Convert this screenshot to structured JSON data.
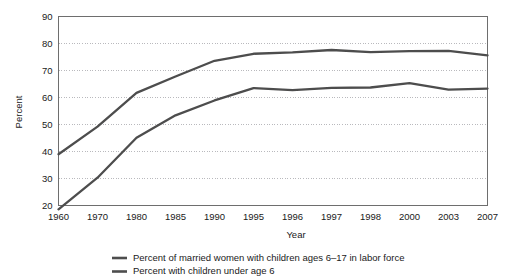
{
  "chart_data": {
    "type": "line",
    "title": "",
    "xlabel": "Year",
    "ylabel": "Percent",
    "ylim": [
      20,
      90
    ],
    "y_ticks": [
      20,
      30,
      40,
      50,
      60,
      70,
      80,
      90
    ],
    "grid": true,
    "legend_position": "bottom",
    "categories": [
      "1960",
      "1970",
      "1980",
      "1985",
      "1990",
      "1995",
      "1996",
      "1997",
      "1998",
      "2000",
      "2003",
      "2007"
    ],
    "series": [
      {
        "name": "Percent of married women with children ages 6–17 in labor force",
        "color": "#4d4d4d",
        "values": [
          39.0,
          49.2,
          61.7,
          67.8,
          73.6,
          76.2,
          76.7,
          77.6,
          76.8,
          77.2,
          77.3,
          75.6
        ]
      },
      {
        "name": "Percent with children under age 6",
        "color": "#4d4d4d",
        "values": [
          18.6,
          30.3,
          45.1,
          53.4,
          58.9,
          63.5,
          62.7,
          63.6,
          63.7,
          65.3,
          62.9,
          63.3
        ]
      }
    ]
  },
  "axis": {
    "y_title": "Percent",
    "x_title": "Year",
    "y_tick_labels": [
      "90",
      "80",
      "70",
      "60",
      "50",
      "40",
      "30",
      "20"
    ],
    "x_tick_labels": [
      "1960",
      "1970",
      "1980",
      "1985",
      "1990",
      "1995",
      "1996",
      "1997",
      "1998",
      "2000",
      "2003",
      "2007"
    ]
  },
  "legend": {
    "items": [
      {
        "label": "Percent of married women with children ages 6–17 in labor force",
        "color": "#4d4d4d"
      },
      {
        "label": "Percent with children under age 6",
        "color": "#4d4d4d"
      }
    ]
  },
  "colors": {
    "background": "#ffffff",
    "plot_border": "#6e6e6e",
    "gridline": "#b9b9bd",
    "series": "#4d4d4d",
    "text": "#1a1a1a"
  }
}
